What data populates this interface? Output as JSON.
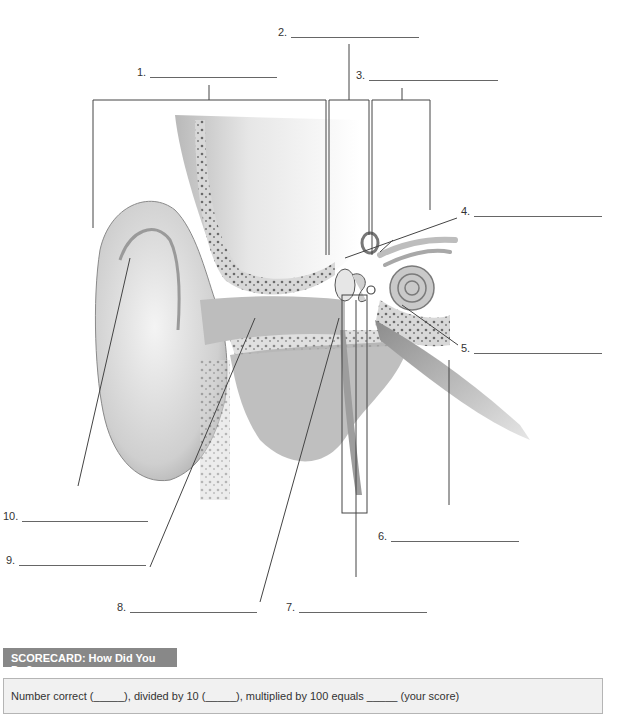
{
  "diagram": {
    "labels": [
      {
        "number": "1.",
        "blank": "________________________"
      },
      {
        "number": "2.",
        "blank": "________________________"
      },
      {
        "number": "3.",
        "blank": "________________________"
      },
      {
        "number": "4.",
        "blank": "________________________"
      },
      {
        "number": "5.",
        "blank": "________________________"
      },
      {
        "number": "6.",
        "blank": "________________________"
      },
      {
        "number": "7.",
        "blank": "________________________"
      },
      {
        "number": "8.",
        "blank": "________________________"
      },
      {
        "number": "9.",
        "blank": "________________________"
      },
      {
        "number": "10.",
        "blank": "________________________"
      }
    ]
  },
  "scorecard": {
    "title": "SCORECARD: How Did You Do?",
    "text": "Number correct (_____), divided by 10 (_____), multiplied by 100 equals _____ (your score)"
  }
}
